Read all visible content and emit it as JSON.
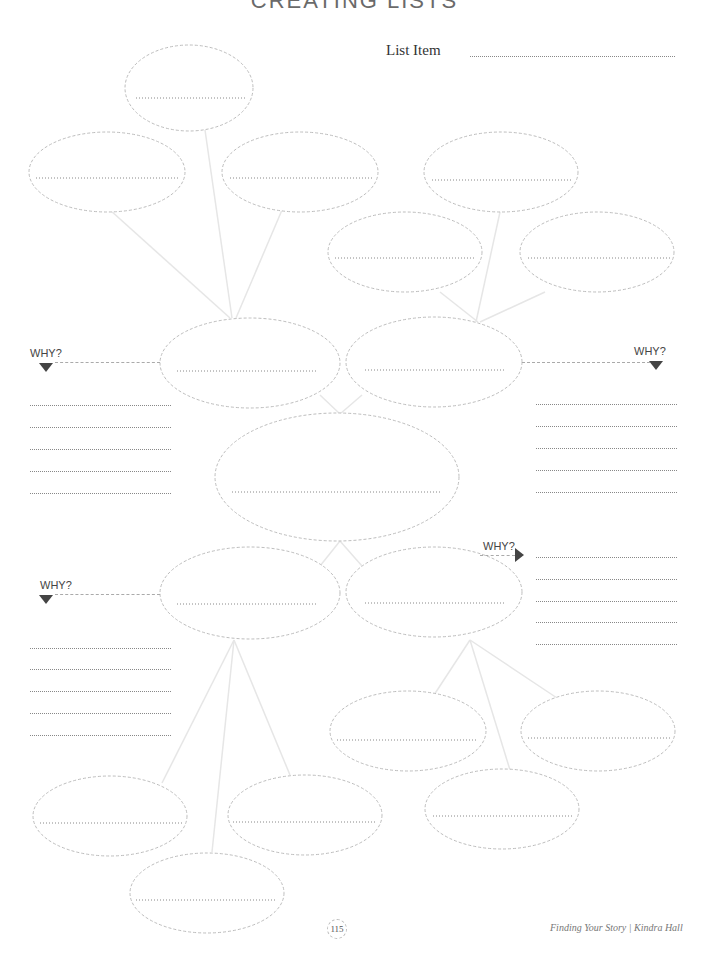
{
  "page": {
    "title": "CREATING LISTS",
    "list_item_label": "List Item",
    "why_label": "WHY?",
    "page_number": "115",
    "footer": "Finding Your Story | Kindra Hall"
  },
  "colors": {
    "ellipse_stroke": "#bdbdbd",
    "connector": "#e6e6e6",
    "writing_line": "#888888",
    "arrow": "#444444",
    "text": "#333333"
  }
}
